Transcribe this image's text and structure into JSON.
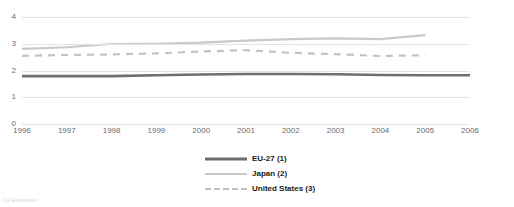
{
  "chart_data": {
    "type": "line",
    "title": "",
    "subtitle": "",
    "xlabel": "",
    "ylabel": "",
    "grid": true,
    "legend_position": "bottom-center",
    "ylim": [
      0,
      4
    ],
    "yticks": [
      "0",
      "1",
      "2",
      "3",
      "4"
    ],
    "categories": [
      "1996",
      "1997",
      "1998",
      "1999",
      "2000",
      "2001",
      "2002",
      "2003",
      "2004",
      "2005",
      "2006"
    ],
    "series": [
      {
        "name": "EU-27 (1)",
        "color": "#6e6e6e",
        "style": "solid",
        "width": 2.6,
        "values": [
          1.79,
          1.79,
          1.79,
          1.82,
          1.85,
          1.87,
          1.87,
          1.86,
          1.83,
          1.82,
          1.82
        ]
      },
      {
        "name": "Japan (2)",
        "color": "#c9c9c9",
        "style": "solid",
        "width": 2.2,
        "values": [
          2.81,
          2.87,
          2.99,
          3.0,
          3.04,
          3.12,
          3.17,
          3.2,
          3.17,
          3.32,
          null
        ]
      },
      {
        "name": "United States (3)",
        "color": "#c2c2c2",
        "style": "dashed",
        "width": 2.2,
        "values": [
          2.55,
          2.58,
          2.6,
          2.64,
          2.71,
          2.76,
          2.66,
          2.61,
          2.54,
          2.57,
          null
        ]
      }
    ]
  },
  "legend": {
    "items": [
      {
        "label": "EU-27 (1)"
      },
      {
        "label": "Japan (2)"
      },
      {
        "label": "United States (3)"
      }
    ]
  },
  "footnote": {
    "text": "(1) Estimates."
  }
}
